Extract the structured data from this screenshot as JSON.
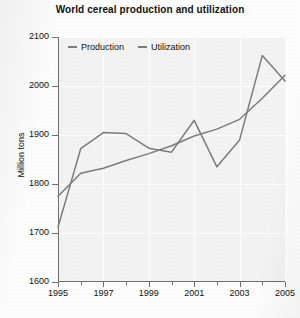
{
  "chart_data": {
    "type": "line",
    "title": "World cereal production and utilization",
    "xlabel": "",
    "ylabel": "Million tons",
    "x": [
      1995,
      1996,
      1997,
      1998,
      1999,
      2000,
      2001,
      2002,
      2003,
      2004,
      2005
    ],
    "xlim": [
      1995,
      2005
    ],
    "ylim": [
      1600,
      2100
    ],
    "yticks": [
      1600,
      1700,
      1800,
      1900,
      2000,
      2100
    ],
    "xticks_major": [
      1995,
      1997,
      1999,
      2001,
      2003,
      2005
    ],
    "xticks_minor": [
      1996,
      1998,
      2000,
      2002,
      2004
    ],
    "grid": true,
    "legend_position": "top-left-inside",
    "series": [
      {
        "name": "Production",
        "color": "#7d7d7d",
        "values": [
          1712,
          1872,
          1905,
          1903,
          1873,
          1865,
          1930,
          1835,
          1890,
          2062,
          2010
        ]
      },
      {
        "name": "Utilization",
        "color": "#7d7d7d",
        "values": [
          1775,
          1822,
          1832,
          1848,
          1862,
          1878,
          1898,
          1912,
          1932,
          1975,
          2022
        ]
      }
    ]
  },
  "axes": {
    "y_tick_labels": [
      "2100",
      "2000",
      "1900",
      "1800",
      "1700",
      "1600"
    ],
    "x_tick_labels": [
      "1995",
      "1997",
      "1999",
      "2001",
      "2003",
      "2005"
    ],
    "y_axis_title": "Million tons"
  },
  "legend": {
    "items": [
      {
        "label": "Production"
      },
      {
        "label": "Utilization"
      }
    ]
  },
  "colors": {
    "line": "#7d7d7d",
    "axis": "#6f6f6f",
    "plot_background": "#f4f4f4",
    "gridline": "#ffffff",
    "text": "#111111"
  }
}
